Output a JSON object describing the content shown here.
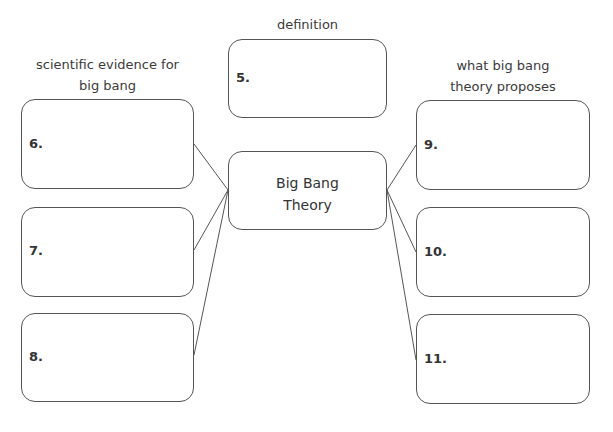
{
  "diagram": {
    "center": {
      "label_line1": "Big Bang",
      "label_line2": "Theory"
    },
    "headings": {
      "definition": "definition",
      "evidence_line1": "scientific evidence for",
      "evidence_line2": "big bang",
      "proposes_line1": "what big bang",
      "proposes_line2": "theory proposes"
    },
    "boxes": {
      "b5": "5.",
      "b6": "6.",
      "b7": "7.",
      "b8": "8.",
      "b9": "9.",
      "b10": "10.",
      "b11": "11."
    }
  }
}
